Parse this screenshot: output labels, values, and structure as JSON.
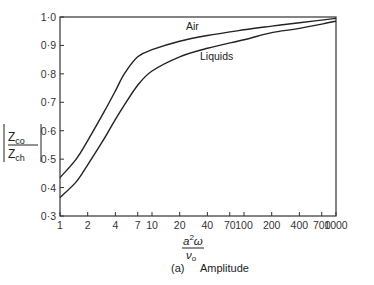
{
  "chart_data": {
    "type": "line",
    "title": "",
    "caption": "(a)  Amplitude",
    "caption_letter": "(a)",
    "caption_text": "Amplitude",
    "xlabel": "a²ω / ν₀",
    "xlabel_parts": {
      "numerator": "a",
      "sup": "2",
      "omega": "ω",
      "denominator": "ν",
      "sub": "o"
    },
    "ylabel": "|Z_co / Z_ch|",
    "ylabel_parts": {
      "num": "Z",
      "num_sub": "co",
      "den": "Z",
      "den_sub": "ch"
    },
    "x_scale": "log",
    "xlim": [
      1,
      1000
    ],
    "ylim": [
      0.3,
      1.0
    ],
    "grid": false,
    "legend": "inline labels",
    "x_ticks": [
      1,
      2,
      4,
      7,
      10,
      20,
      40,
      70,
      100,
      200,
      400,
      700,
      1000
    ],
    "x_tick_labels": [
      "1",
      "2",
      "4",
      "7",
      "10",
      "20",
      "40",
      "70",
      "100",
      "200",
      "400",
      "700",
      "1000"
    ],
    "y_ticks": [
      0.3,
      0.4,
      0.5,
      0.6,
      0.7,
      0.8,
      0.9,
      1.0
    ],
    "y_tick_labels": [
      "0·3",
      "0·4",
      "0·5",
      "0·6",
      "0·7",
      "0·8",
      "0·9",
      "1·0"
    ],
    "x": [
      1,
      1.5,
      2,
      3,
      4,
      5,
      7,
      10,
      20,
      40,
      100,
      200,
      400,
      1000
    ],
    "series": [
      {
        "name": "Air",
        "values": [
          0.435,
          0.5,
          0.565,
          0.665,
          0.74,
          0.8,
          0.86,
          0.885,
          0.915,
          0.935,
          0.955,
          0.968,
          0.98,
          0.995
        ]
      },
      {
        "name": "Liquids",
        "values": [
          0.365,
          0.42,
          0.48,
          0.57,
          0.64,
          0.69,
          0.76,
          0.81,
          0.86,
          0.89,
          0.92,
          0.945,
          0.96,
          0.985
        ]
      }
    ],
    "annotations": [
      {
        "text": "Air",
        "near_x": 20,
        "near_y": 0.94
      },
      {
        "text": "Liquids",
        "near_x": 40,
        "near_y": 0.84
      }
    ]
  },
  "colors": {
    "line": "#222222",
    "axis": "#333333",
    "background": "#ffffff"
  }
}
